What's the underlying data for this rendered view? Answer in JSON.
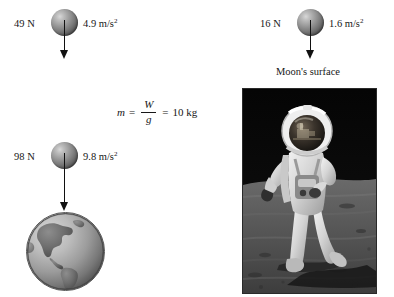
{
  "figure": {
    "background_color": "#ffffff",
    "ink_color": "#171717"
  },
  "moon_scenario": {
    "force_label": "16 N",
    "acceleration_label": "1.6 m/s",
    "acceleration_exponent": "2",
    "surface_caption": "Moon's surface",
    "ball_icon": "sphere-mass-icon",
    "arrow_icon": "down-arrow-icon",
    "photo_icon": "astronaut-moon-photo"
  },
  "half_gravity_scenario": {
    "force_label": "49 N",
    "acceleration_label": "4.9 m/s",
    "acceleration_exponent": "2",
    "ball_icon": "sphere-mass-icon",
    "arrow_icon": "down-arrow-icon"
  },
  "earth_scenario": {
    "force_label": "98 N",
    "acceleration_label": "9.8 m/s",
    "acceleration_exponent": "2",
    "ball_icon": "sphere-mass-icon",
    "arrow_icon": "down-arrow-icon",
    "globe_icon": "earth-globe-icon"
  },
  "equation": {
    "variable": "m",
    "equals_first": "=",
    "numerator": "W",
    "denominator": "g",
    "equals_second": "=",
    "result": "10 kg"
  }
}
